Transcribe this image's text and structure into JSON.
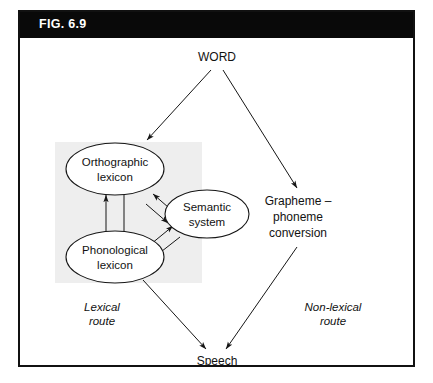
{
  "figure": {
    "header_label": "FIG. 6.9",
    "header_bg": "#090909",
    "header_text_color": "#ffffff",
    "border_color": "#111111",
    "background": "#ffffff",
    "shade_color": "#eeeeee"
  },
  "diagram": {
    "type": "flow-diagram",
    "input_node": {
      "id": "word",
      "label": "WORD"
    },
    "output_node": {
      "id": "speech",
      "label": "Speech"
    },
    "boxes": [
      {
        "id": "orthographic-lexicon",
        "label_line1": "Orthographic",
        "label_line2": "lexicon",
        "shape": "ellipse"
      },
      {
        "id": "phonological-lexicon",
        "label_line1": "Phonological",
        "label_line2": "lexicon",
        "shape": "ellipse"
      },
      {
        "id": "semantic-system",
        "label_line1": "Semantic",
        "label_line2": "system",
        "shape": "ellipse"
      }
    ],
    "process_node": {
      "id": "grapheme-phoneme-conversion",
      "label_line1": "Grapheme –",
      "label_line2": "phoneme",
      "label_line3": "conversion"
    },
    "route_labels": [
      {
        "id": "lexical-route",
        "line1": "Lexical",
        "line2": "route"
      },
      {
        "id": "non-lexical-route",
        "line1": "Non-lexical",
        "line2": "route"
      }
    ],
    "connections": [
      {
        "from": "word",
        "to": "orthographic-lexicon",
        "direction": "one-way"
      },
      {
        "from": "word",
        "to": "grapheme-phoneme-conversion",
        "direction": "one-way"
      },
      {
        "from": "orthographic-lexicon",
        "to": "phonological-lexicon",
        "direction": "two-way"
      },
      {
        "from": "orthographic-lexicon",
        "to": "semantic-system",
        "direction": "two-way"
      },
      {
        "from": "phonological-lexicon",
        "to": "semantic-system",
        "direction": "two-way"
      },
      {
        "from": "phonological-lexicon",
        "to": "speech",
        "direction": "one-way"
      },
      {
        "from": "grapheme-phoneme-conversion",
        "to": "speech",
        "direction": "one-way"
      }
    ]
  }
}
